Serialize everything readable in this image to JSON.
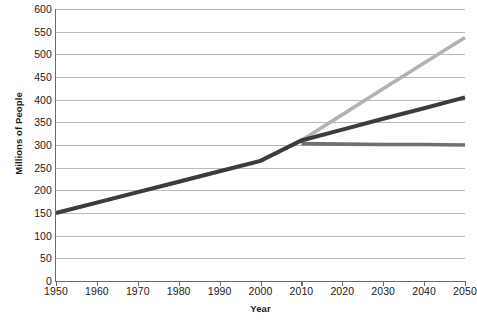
{
  "chart_data": {
    "type": "line",
    "title": "",
    "xlabel": "Year",
    "ylabel": "Millions of People",
    "xlim": [
      1950,
      2050
    ],
    "ylim": [
      0,
      600
    ],
    "grid": true,
    "legend": "none",
    "x_ticks": [
      1950,
      1960,
      1970,
      1980,
      1990,
      2000,
      2010,
      2020,
      2030,
      2040,
      2050
    ],
    "y_ticks": [
      0,
      50,
      100,
      150,
      200,
      250,
      300,
      350,
      400,
      450,
      500,
      550,
      600
    ],
    "series": [
      {
        "name": "high-growth-projection",
        "color": "#b3b3b3",
        "x": [
          1950,
          1960,
          1970,
          1980,
          1990,
          2000,
          2010,
          2020,
          2030,
          2040,
          2050
        ],
        "values": [
          150,
          173,
          196,
          219,
          242,
          265,
          310,
          367,
          424,
          481,
          537
        ]
      },
      {
        "name": "medium-growth-projection",
        "color": "#3c3c3c",
        "x": [
          1950,
          1960,
          1970,
          1980,
          1990,
          2000,
          2010,
          2020,
          2030,
          2040,
          2050
        ],
        "values": [
          150,
          173,
          196,
          219,
          242,
          265,
          310,
          334,
          358,
          381,
          405
        ]
      },
      {
        "name": "zero-growth-projection",
        "color": "#707070",
        "x": [
          2010,
          2020,
          2030,
          2040,
          2050
        ],
        "values": [
          303,
          302,
          301,
          301,
          300
        ]
      }
    ]
  },
  "axes": {
    "y_title": "Millions of People",
    "x_title": "Year"
  }
}
